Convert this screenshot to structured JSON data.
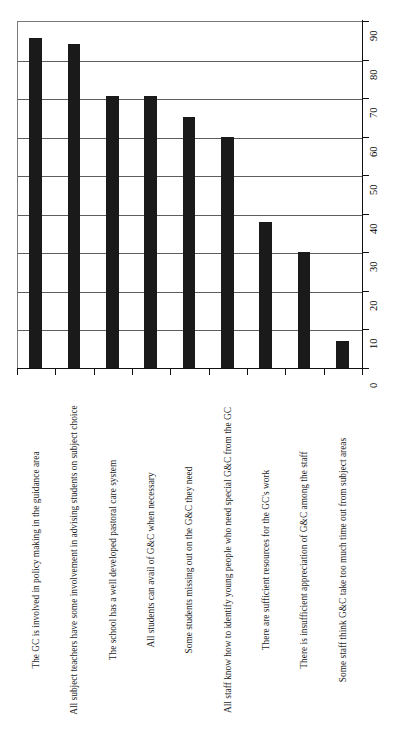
{
  "chart_data": {
    "type": "bar",
    "orientation": "vertical-bars-rotated-canvas",
    "title": "",
    "subtitle": "",
    "xlabel": "",
    "ylabel": "",
    "ylim": [
      0,
      90
    ],
    "ytick_step": 10,
    "grid": true,
    "legend": null,
    "bar_color": "#1a1a1a",
    "gridline_color": "#5e5e5e",
    "axis_color": "#111111",
    "categories": [
      "The GC is involved in policy making in the guidance area",
      "All subject teachers have some involvement in advising students on subject choice",
      "The school has a well developed pastoral care system",
      "All students can avail of G&C when necessary",
      "Some students missing out on the G&C they need",
      "All staff know how to identify young people who need special G&C from the GC",
      "There are sufficient resources for the GC's work",
      "There is insufficient appreciation of G&C among the staff",
      "Some staff think G&C take too much time out from subject areas"
    ],
    "values": [
      85.5,
      84,
      70.5,
      70.5,
      65,
      60,
      38,
      30,
      7
    ],
    "ytick_labels": [
      "0",
      "10",
      "20",
      "30",
      "40",
      "50",
      "60",
      "70",
      "80",
      "90"
    ],
    "ytick_values": [
      0,
      10,
      20,
      30,
      40,
      50,
      60,
      70,
      80,
      90
    ]
  }
}
